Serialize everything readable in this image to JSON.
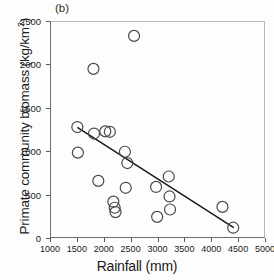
{
  "chart_data": {
    "type": "scatter",
    "title": "",
    "panel_label": "(b)",
    "xlabel": "Rainfall (mm)",
    "ylabel": "Primate community biomass (kg/km2)",
    "ylabel_display": "Primate community biomass (kg/km",
    "ylabel_sup": "2",
    "ylabel_tail": ")",
    "xlim": [
      1000,
      5000
    ],
    "ylim": [
      0,
      2500
    ],
    "xticks": [
      1000,
      1500,
      2000,
      2500,
      3000,
      3500,
      4000,
      4500,
      5000
    ],
    "yticks": [
      0,
      500,
      1000,
      1500,
      2000,
      2500
    ],
    "xtick_labels": [
      "1000",
      "1500",
      "2000",
      "2500",
      "3000",
      "3500",
      "4000",
      "4500",
      "5000"
    ],
    "ytick_labels": [
      "0",
      "500",
      "1000",
      "1500",
      "2000",
      "2500"
    ],
    "grid": false,
    "legend": null,
    "marker": "open-circle",
    "marker_size": 11,
    "marker_color": "#4a4a4a",
    "line_color": "#1a1a1a",
    "axis_color": "#5a5a5a",
    "points": [
      {
        "x": 1490,
        "y": 1290
      },
      {
        "x": 1500,
        "y": 995
      },
      {
        "x": 1790,
        "y": 1960
      },
      {
        "x": 1800,
        "y": 1215
      },
      {
        "x": 1880,
        "y": 670
      },
      {
        "x": 2010,
        "y": 1240
      },
      {
        "x": 2095,
        "y": 1235
      },
      {
        "x": 2160,
        "y": 430
      },
      {
        "x": 2185,
        "y": 360
      },
      {
        "x": 2200,
        "y": 310
      },
      {
        "x": 2375,
        "y": 1005
      },
      {
        "x": 2390,
        "y": 590
      },
      {
        "x": 2420,
        "y": 875
      },
      {
        "x": 2545,
        "y": 2340
      },
      {
        "x": 2955,
        "y": 600
      },
      {
        "x": 2975,
        "y": 255
      },
      {
        "x": 3190,
        "y": 720
      },
      {
        "x": 3205,
        "y": 490
      },
      {
        "x": 3215,
        "y": 340
      },
      {
        "x": 4190,
        "y": 370
      },
      {
        "x": 4390,
        "y": 130
      }
    ],
    "trend_line": {
      "type": "linear-fit",
      "x_start": 1490,
      "y_start": 1285,
      "x_end": 4400,
      "y_end": 130
    }
  }
}
